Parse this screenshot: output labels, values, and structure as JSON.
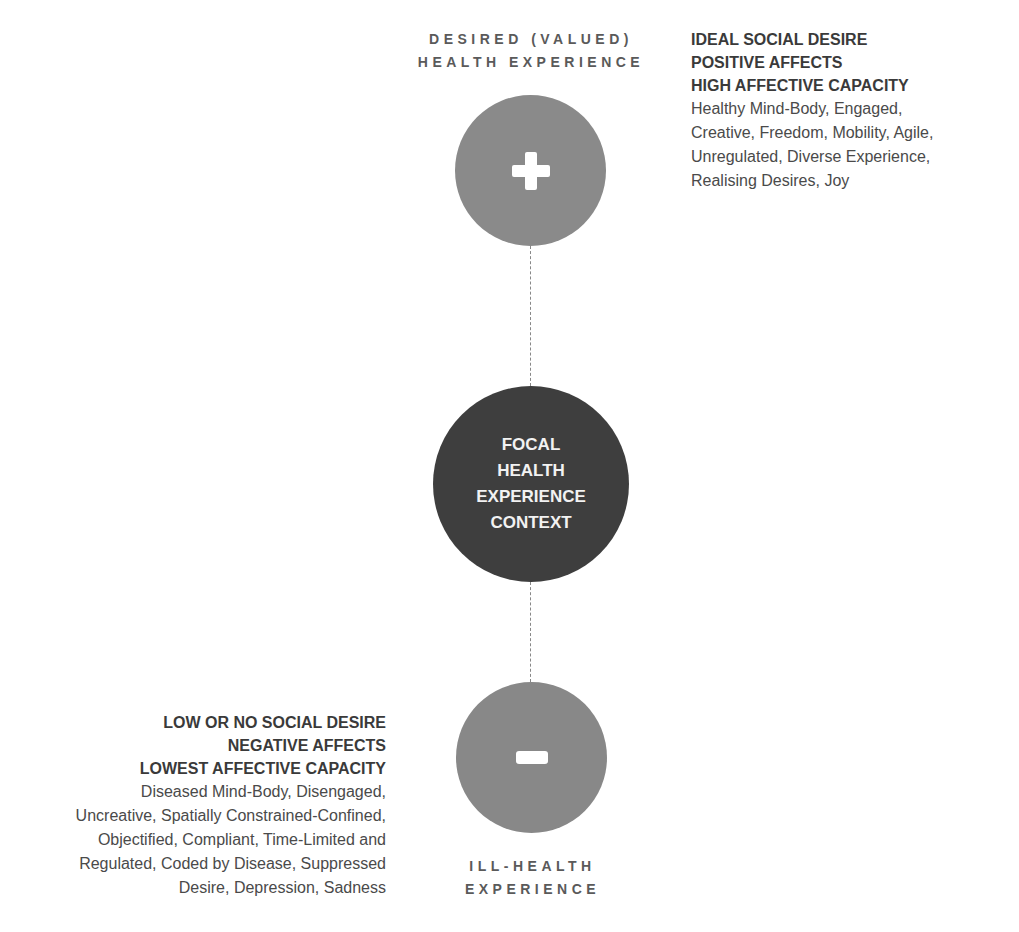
{
  "diagram": {
    "top_node": {
      "title_lines": [
        "DESIRED (VALUED)",
        "HEALTH EXPERIENCE"
      ],
      "symbol": "plus-icon",
      "color": "#8a8a8a",
      "heading_lines": [
        "IDEAL SOCIAL DESIRE",
        "POSITIVE AFFECTS",
        "HIGH AFFECTIVE CAPACITY"
      ],
      "description_lines": [
        "Healthy Mind-Body, Engaged,",
        "Creative, Freedom, Mobility, Agile,",
        "Unregulated, Diverse Experience,",
        "Realising Desires, Joy"
      ]
    },
    "center_node": {
      "label_lines": [
        "FOCAL",
        "HEALTH",
        "EXPERIENCE",
        "CONTEXT"
      ],
      "color": "#3e3e3e"
    },
    "bottom_node": {
      "title_lines": [
        "ILL-HEALTH",
        "EXPERIENCE"
      ],
      "symbol": "minus-icon",
      "color": "#888888",
      "heading_lines": [
        "LOW OR NO SOCIAL DESIRE",
        "NEGATIVE AFFECTS",
        "LOWEST AFFECTIVE CAPACITY"
      ],
      "description_lines": [
        "Diseased Mind-Body, Disengaged,",
        "Uncreative, Spatially Constrained-Confined,",
        "Objectified, Compliant, Time-Limited and",
        "Regulated, Coded by Disease, Suppressed",
        "Desire, Depression, Sadness"
      ]
    },
    "connectors": [
      {
        "from": "top_node",
        "to": "center_node",
        "style": "dashed"
      },
      {
        "from": "center_node",
        "to": "bottom_node",
        "style": "dashed"
      }
    ]
  }
}
